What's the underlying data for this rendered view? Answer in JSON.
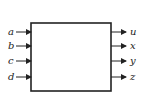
{
  "diagram": {
    "type": "block",
    "block": {
      "x": 31,
      "y": 23,
      "width": 80,
      "height": 68
    },
    "inputs": [
      {
        "label": "a",
        "y": 32
      },
      {
        "label": "b",
        "y": 46
      },
      {
        "label": "c",
        "y": 61
      },
      {
        "label": "d",
        "y": 77
      }
    ],
    "outputs": [
      {
        "label": "u",
        "y": 32
      },
      {
        "label": "x",
        "y": 46
      },
      {
        "label": "y",
        "y": 61
      },
      {
        "label": "z",
        "y": 77
      }
    ],
    "colors": {
      "stroke": "#222222",
      "background": "#ffffff"
    }
  }
}
